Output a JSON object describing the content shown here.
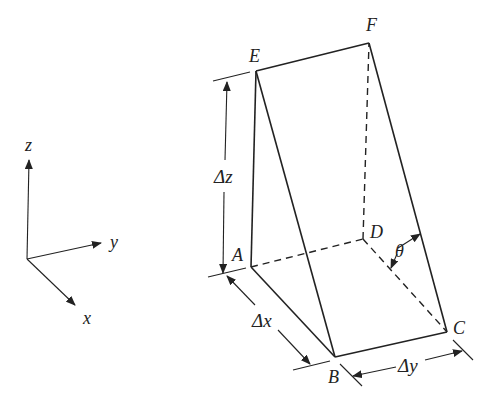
{
  "diagram": {
    "type": "geometry-wedge",
    "axes": {
      "z_label": "z",
      "y_label": "y",
      "x_label": "x"
    },
    "vertices": {
      "A": "A",
      "B": "B",
      "C": "C",
      "D": "D",
      "E": "E",
      "F": "F"
    },
    "dimensions": {
      "dz": "Δz",
      "dx": "Δx",
      "dy": "Δy",
      "angle": "θ"
    },
    "colors": {
      "stroke": "#222222",
      "background": "#ffffff"
    }
  }
}
